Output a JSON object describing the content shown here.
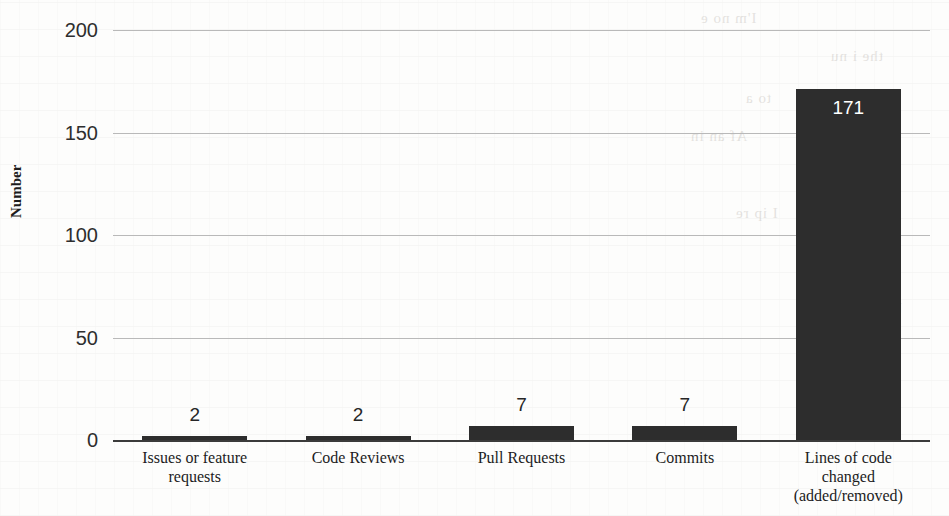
{
  "chart_data": {
    "type": "bar",
    "title": "",
    "xlabel": "",
    "ylabel": "Number",
    "categories": [
      "Issues or feature\nrequests",
      "Code Reviews",
      "Pull Requests",
      "Commits",
      "Lines of code\nchanged\n(added/removed)"
    ],
    "values": [
      2,
      2,
      7,
      7,
      171
    ],
    "value_labels": [
      "2",
      "2",
      "7",
      "7",
      "171"
    ],
    "ylim": [
      0,
      200
    ],
    "yticks": [
      0,
      50,
      100,
      150,
      200
    ],
    "ytick_labels": [
      "0",
      "50",
      "100",
      "150",
      "200"
    ],
    "grid": true,
    "legend": false,
    "bar_color": "#2d2d2d",
    "gridline_color": "#b9b9b9",
    "axis_color": "#3b3b3b",
    "value_label_inside": [
      false,
      false,
      false,
      false,
      true
    ]
  },
  "axis": {
    "y_title": "Number"
  },
  "background_bleed": [
    "I'm no e",
    "the i nu",
    "to a",
    "Af an in",
    "d lo",
    "I ip re",
    "at un t",
    "b o"
  ]
}
